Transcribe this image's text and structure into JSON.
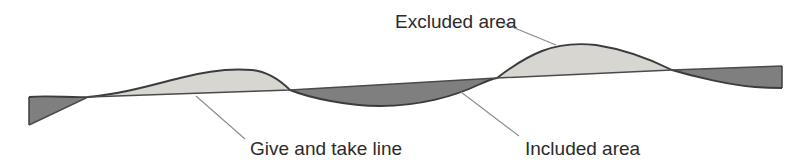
{
  "diagram": {
    "title": "Give and take line",
    "background_color": "#ffffff",
    "width": 800,
    "height": 168,
    "colors": {
      "excluded_fill": "#d7d6d1",
      "included_fill": "#7f7f7f",
      "curve_stroke": "#3c3c3c",
      "chord_stroke": "#4a4a4a",
      "leader_stroke": "#8c8c8c",
      "text": "#2b2b2b"
    },
    "labels": [
      {
        "id": "excluded-area",
        "text": "Excluded area",
        "x": 395,
        "y": 28,
        "anchor": "start",
        "leader": "M 500 22 L 556 45"
      },
      {
        "id": "give-and-take-line",
        "text": "Give and take line",
        "x": 250,
        "y": 154,
        "anchor": "start",
        "leader": "M 196 96 L 245 139"
      },
      {
        "id": "included-area",
        "text": "Included area",
        "x": 525,
        "y": 154,
        "anchor": "start",
        "leader": "M 461 92 L 519 136"
      }
    ],
    "geometry": {
      "x_start": 29,
      "x_end": 782,
      "crossings": [
        {
          "x": 88,
          "y": 97
        },
        {
          "x": 290,
          "y": 90
        },
        {
          "x": 497,
          "y": 78
        },
        {
          "x": 672,
          "y": 70
        }
      ],
      "ground_profile_path": "M 29 97 C 50 95, 70 98, 88 97 C 120 95, 152 86, 180 78 C 205 71, 228 68, 252 70 C 280 73, 300 82, 320 90 C 348 100, 375 106, 400 105 C 430 104, 455 95, 478 85 C 495 78, 503 73, 520 63 C 545 49, 565 45, 585 45 C 612 45, 640 55, 660 63 C 672 68, 690 74, 712 79 C 735 84, 762 87, 782 88",
      "give_take_line_path": "M 29 125 L 88 97 L 290 90 L 497 78 L 672 70 L 782 66",
      "excluded_regions": [
        {
          "id": "hump-1",
          "from_x": 88,
          "to_x": 290,
          "description": "ground above give-and-take line, first rise"
        },
        {
          "id": "hump-2",
          "from_x": 497,
          "to_x": 672,
          "description": "ground above give-and-take line, second rise"
        }
      ],
      "included_regions": [
        {
          "id": "wedge-left",
          "from_x": 29,
          "to_x": 88,
          "description": "ground below give-and-take line, left wedge"
        },
        {
          "id": "trough",
          "from_x": 290,
          "to_x": 497,
          "description": "ground below give-and-take line, central trough"
        },
        {
          "id": "wedge-right",
          "from_x": 672,
          "to_x": 782,
          "description": "ground below give-and-take line, right wedge"
        }
      ]
    }
  }
}
